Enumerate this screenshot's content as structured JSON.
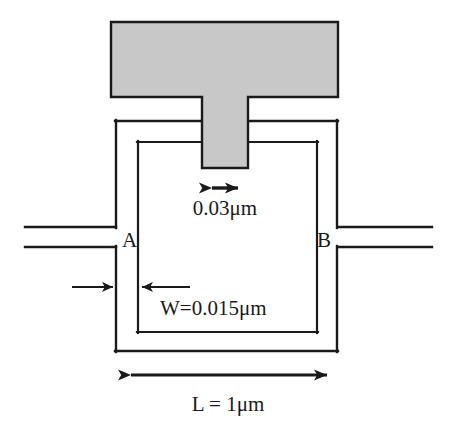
{
  "figure": {
    "type": "technical-diagram",
    "background_color": "#ffffff",
    "line_color": "#1a1a1a",
    "gate_fill_color": "#c8c8c8",
    "gate_outline_color": "#1a1a1a"
  },
  "labels": {
    "terminal_a": "A",
    "terminal_b": "B",
    "gate_width_dim": "0.03μm",
    "arm_width_dim": "W=0.015μm",
    "ring_length_dim": "L = 1μm"
  },
  "elements": {
    "gate_pad_name": "gate-electrode-pad",
    "gate_stem_name": "gate-electrode-stem",
    "ring_outer_name": "ring-outer-boundary",
    "ring_inner_name": "ring-inner-boundary",
    "lead_left_top_name": "lead-left-top",
    "lead_left_bottom_name": "lead-left-bottom",
    "lead_right_top_name": "lead-right-top",
    "lead_right_bottom_name": "lead-right-bottom"
  },
  "dimensions": {
    "gate_width_value": 0.03,
    "gate_width_unit": "μm",
    "arm_width_value": 0.015,
    "arm_width_unit": "μm",
    "ring_length_value": 1,
    "ring_length_unit": "μm"
  }
}
